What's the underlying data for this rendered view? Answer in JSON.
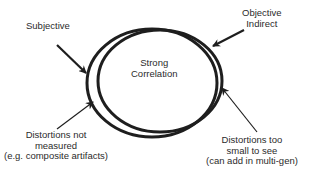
{
  "diagram": {
    "labels": {
      "subjective": "Subjective",
      "objective_indirect": [
        "Objective",
        "Indirect"
      ],
      "strong_correlation": [
        "Strong",
        "Correlation"
      ],
      "distortions_not_measured": [
        "Distortions not",
        "measured",
        "(e.g. composite artifacts)"
      ],
      "distortions_too_small": [
        "Distortions too",
        "small to see",
        "(can add in multi-gen)"
      ]
    },
    "colors": {
      "stroke": "#1e1e1e",
      "text": "#2b2b2b",
      "background": "#ffffff"
    },
    "shapes": {
      "subjective_ellipse": {
        "cx": 152,
        "cy": 82,
        "rx": 66,
        "ry": 54
      },
      "objective_ellipse": {
        "cx": 160,
        "cy": 80,
        "rx": 62,
        "ry": 51
      }
    }
  }
}
